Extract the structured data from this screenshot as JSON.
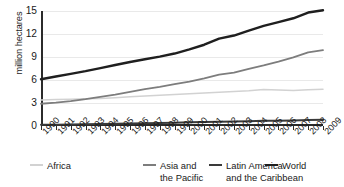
{
  "chart_data": {
    "type": "line",
    "title": "",
    "subtitle": "",
    "xlabel": "",
    "ylabel": "million hectares",
    "x": [
      1990,
      1991,
      1992,
      1993,
      1994,
      1995,
      1996,
      1997,
      1998,
      1999,
      2000,
      2001,
      2002,
      2003,
      2004,
      2005,
      2006,
      2007,
      2008,
      2009
    ],
    "xtick_labels": [
      "1990",
      "1991",
      "1992",
      "1993",
      "1994",
      "1995",
      "1996",
      "1997",
      "1998",
      "1999",
      "2000",
      "2001",
      "2002",
      "2003",
      "2004",
      "2005",
      "2006",
      "2007",
      "2008",
      "2009"
    ],
    "ytick_labels": [
      "0",
      "3",
      "6",
      "9",
      "12",
      "15"
    ],
    "yticks": [
      0,
      3,
      6,
      9,
      12,
      15
    ],
    "ylim": [
      0,
      15
    ],
    "xlim": [
      1990,
      2009
    ],
    "grid": "horizontal",
    "legend_position": "bottom",
    "series": [
      {
        "name": "Africa",
        "color": "#d2d2d2",
        "width": 1.5,
        "values": [
          3.4,
          3.45,
          3.5,
          3.55,
          3.6,
          3.7,
          3.8,
          3.9,
          4.0,
          4.1,
          4.2,
          4.3,
          4.4,
          4.5,
          4.6,
          4.75,
          4.7,
          4.62,
          4.72,
          4.8
        ]
      },
      {
        "name": "Asia and\nthe Pacific",
        "color": "#7d7d7d",
        "width": 1.8,
        "values": [
          2.9,
          3.05,
          3.25,
          3.5,
          3.8,
          4.1,
          4.45,
          4.8,
          5.1,
          5.45,
          5.8,
          6.2,
          6.7,
          6.95,
          7.45,
          7.9,
          8.4,
          8.95,
          9.6,
          9.9
        ]
      },
      {
        "name": "Latin America\nand the Caribbean",
        "color": "#3a3a3a",
        "width": 2.0,
        "values": [
          0.15,
          0.17,
          0.2,
          0.22,
          0.25,
          0.28,
          0.32,
          0.36,
          0.4,
          0.44,
          0.48,
          0.52,
          0.56,
          0.6,
          0.63,
          0.67,
          0.7,
          0.73,
          0.77,
          0.8
        ]
      },
      {
        "name": "World",
        "color": "#1f1f1f",
        "width": 2.4,
        "values": [
          6.1,
          6.45,
          6.8,
          7.15,
          7.55,
          7.95,
          8.35,
          8.7,
          9.05,
          9.45,
          10.0,
          10.6,
          11.4,
          11.8,
          12.45,
          13.05,
          13.55,
          14.05,
          14.8,
          15.1
        ]
      }
    ],
    "legend": [
      {
        "label": "Africa",
        "color": "#d2d2d2",
        "swatch_height": 1.6
      },
      {
        "label": "Asia and\nthe Pacific",
        "color": "#7d7d7d",
        "swatch_height": 1.9
      },
      {
        "label": "Latin America\nand the Caribbean",
        "color": "#3a3a3a",
        "swatch_height": 2.2
      },
      {
        "label": "World",
        "color": "#1f1f1f",
        "swatch_height": 2.4
      }
    ]
  }
}
